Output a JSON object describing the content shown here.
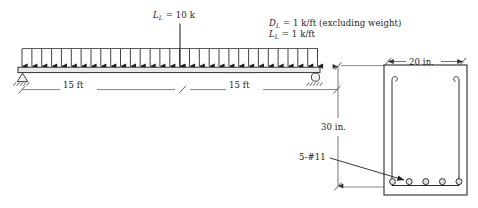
{
  "figure": {
    "type": "structural-engineering-diagram",
    "line_color": "#2b2b2b",
    "text_color": "#1c1c1c"
  },
  "beam_diagram": {
    "point_load": {
      "symbol": "L",
      "subscript": "L",
      "equals": "=",
      "value": "10 k",
      "full_label": "L_L = 10 k"
    },
    "distributed_loads": {
      "dead": {
        "symbol": "D",
        "subscript": "L",
        "equals": "=",
        "value": "1 k/ft",
        "note": "(excluding weight)",
        "full_label": "D_L = 1 k/ft (excluding weight)"
      },
      "live": {
        "symbol": "L",
        "subscript": "L",
        "equals": "=",
        "value": "1 k/ft",
        "note": "",
        "full_label": "L_L = 1 k/ft"
      },
      "arrow_count": 31
    },
    "spans": [
      {
        "label": "15 ft"
      },
      {
        "label": "15 ft"
      }
    ],
    "supports": {
      "left": "pin-support",
      "right": "roller-support"
    }
  },
  "cross_section": {
    "width": {
      "label": "20 in."
    },
    "depth": {
      "label": "30 in."
    },
    "reinforcement": {
      "label": "5-#11",
      "bar_count": 5
    },
    "stirrup": "u-stirrup-with-hooks"
  }
}
